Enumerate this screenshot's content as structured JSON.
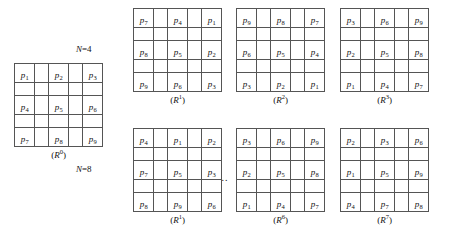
{
  "figure": {
    "caption_prefix": "(",
    "caption_suffix": ")",
    "ellipsis": "...",
    "rows": [
      {
        "id": "row-n4",
        "n_label_text": "N=4",
        "n_label_var": "N",
        "n_label_rest": "=4"
      },
      {
        "id": "row-n8",
        "n_label_text": "N=8",
        "n_label_var": "N",
        "n_label_rest": "=8"
      }
    ]
  },
  "grids": [
    {
      "id": "grid-r0",
      "name": "base-grid",
      "caption_symbol": "R",
      "caption_exponent": "0",
      "caption_full": "(R0)",
      "cells": [
        [
          "p1",
          "",
          "p2",
          "",
          "p3"
        ],
        [
          "",
          "",
          "",
          "",
          ""
        ],
        [
          "p4",
          "",
          "p5",
          "",
          "p6"
        ],
        [
          "",
          "",
          "",
          "",
          ""
        ],
        [
          "p7",
          "",
          "p8",
          "",
          "p9"
        ]
      ],
      "labels": [
        [
          {
            "base": "p",
            "sub": "1"
          },
          null,
          {
            "base": "p",
            "sub": "2"
          },
          null,
          {
            "base": "p",
            "sub": "3"
          }
        ],
        [
          null,
          null,
          null,
          null,
          null
        ],
        [
          {
            "base": "p",
            "sub": "4"
          },
          null,
          {
            "base": "p",
            "sub": "5"
          },
          null,
          {
            "base": "p",
            "sub": "6"
          }
        ],
        [
          null,
          null,
          null,
          null,
          null
        ],
        [
          {
            "base": "p",
            "sub": "7"
          },
          null,
          {
            "base": "p",
            "sub": "8"
          },
          null,
          {
            "base": "p",
            "sub": "9"
          }
        ]
      ]
    },
    {
      "id": "grid-n4-r1",
      "name": "n4-rotation-1",
      "caption_symbol": "R",
      "caption_exponent": "1",
      "caption_full": "(R1)",
      "labels": [
        [
          {
            "base": "p",
            "sub": "7"
          },
          null,
          {
            "base": "p",
            "sub": "4"
          },
          null,
          {
            "base": "p",
            "sub": "1"
          }
        ],
        [
          null,
          null,
          null,
          null,
          null
        ],
        [
          {
            "base": "p",
            "sub": "8"
          },
          null,
          {
            "base": "p",
            "sub": "5"
          },
          null,
          {
            "base": "p",
            "sub": "2"
          }
        ],
        [
          null,
          null,
          null,
          null,
          null
        ],
        [
          {
            "base": "p",
            "sub": "9"
          },
          null,
          {
            "base": "p",
            "sub": "6"
          },
          null,
          {
            "base": "p",
            "sub": "3"
          }
        ]
      ]
    },
    {
      "id": "grid-n4-r2",
      "name": "n4-rotation-2",
      "caption_symbol": "R",
      "caption_exponent": "2",
      "caption_full": "(R2)",
      "labels": [
        [
          {
            "base": "p",
            "sub": "9"
          },
          null,
          {
            "base": "p",
            "sub": "8"
          },
          null,
          {
            "base": "p",
            "sub": "7"
          }
        ],
        [
          null,
          null,
          null,
          null,
          null
        ],
        [
          {
            "base": "p",
            "sub": "6"
          },
          null,
          {
            "base": "p",
            "sub": "5"
          },
          null,
          {
            "base": "p",
            "sub": "4"
          }
        ],
        [
          null,
          null,
          null,
          null,
          null
        ],
        [
          {
            "base": "p",
            "sub": "3"
          },
          null,
          {
            "base": "p",
            "sub": "2"
          },
          null,
          {
            "base": "p",
            "sub": "1"
          }
        ]
      ]
    },
    {
      "id": "grid-n4-r3",
      "name": "n4-rotation-3",
      "caption_symbol": "R",
      "caption_exponent": "3",
      "caption_full": "(R3)",
      "labels": [
        [
          {
            "base": "p",
            "sub": "3"
          },
          null,
          {
            "base": "p",
            "sub": "6"
          },
          null,
          {
            "base": "p",
            "sub": "9"
          }
        ],
        [
          null,
          null,
          null,
          null,
          null
        ],
        [
          {
            "base": "p",
            "sub": "2"
          },
          null,
          {
            "base": "p",
            "sub": "5"
          },
          null,
          {
            "base": "p",
            "sub": "8"
          }
        ],
        [
          null,
          null,
          null,
          null,
          null
        ],
        [
          {
            "base": "p",
            "sub": "1"
          },
          null,
          {
            "base": "p",
            "sub": "4"
          },
          null,
          {
            "base": "p",
            "sub": "7"
          }
        ]
      ]
    },
    {
      "id": "grid-n8-r1",
      "name": "n8-rotation-1",
      "caption_symbol": "R",
      "caption_exponent": "1",
      "caption_full": "(R1)",
      "labels": [
        [
          {
            "base": "p",
            "sub": "4"
          },
          null,
          {
            "base": "p",
            "sub": "1"
          },
          null,
          {
            "base": "p",
            "sub": "2"
          }
        ],
        [
          null,
          null,
          null,
          null,
          null
        ],
        [
          {
            "base": "p",
            "sub": "7"
          },
          null,
          {
            "base": "p",
            "sub": "5"
          },
          null,
          {
            "base": "p",
            "sub": "3"
          }
        ],
        [
          null,
          null,
          null,
          null,
          null
        ],
        [
          {
            "base": "p",
            "sub": "8"
          },
          null,
          {
            "base": "p",
            "sub": "9"
          },
          null,
          {
            "base": "p",
            "sub": "6"
          }
        ]
      ]
    },
    {
      "id": "grid-n8-r6",
      "name": "n8-rotation-6",
      "caption_symbol": "R",
      "caption_exponent": "6",
      "caption_full": "(R6)",
      "labels": [
        [
          {
            "base": "p",
            "sub": "3"
          },
          null,
          {
            "base": "p",
            "sub": "6"
          },
          null,
          {
            "base": "p",
            "sub": "9"
          }
        ],
        [
          null,
          null,
          null,
          null,
          null
        ],
        [
          {
            "base": "p",
            "sub": "2"
          },
          null,
          {
            "base": "p",
            "sub": "5"
          },
          null,
          {
            "base": "p",
            "sub": "8"
          }
        ],
        [
          null,
          null,
          null,
          null,
          null
        ],
        [
          {
            "base": "p",
            "sub": "1"
          },
          null,
          {
            "base": "p",
            "sub": "4"
          },
          null,
          {
            "base": "p",
            "sub": "7"
          }
        ]
      ]
    },
    {
      "id": "grid-n8-r7",
      "name": "n8-rotation-7",
      "caption_symbol": "R",
      "caption_exponent": "7",
      "caption_full": "(R7)",
      "labels": [
        [
          {
            "base": "p",
            "sub": "2"
          },
          null,
          {
            "base": "p",
            "sub": "3"
          },
          null,
          {
            "base": "p",
            "sub": "6"
          }
        ],
        [
          null,
          null,
          null,
          null,
          null
        ],
        [
          {
            "base": "p",
            "sub": "1"
          },
          null,
          {
            "base": "p",
            "sub": "5"
          },
          null,
          {
            "base": "p",
            "sub": "9"
          }
        ],
        [
          null,
          null,
          null,
          null,
          null
        ],
        [
          {
            "base": "p",
            "sub": "4"
          },
          null,
          {
            "base": "p",
            "sub": "7"
          },
          null,
          {
            "base": "p",
            "sub": "8"
          }
        ]
      ]
    }
  ],
  "layout": {
    "grid_positions": {
      "grid-r0": {
        "left": 14,
        "top": 63
      },
      "grid-n4-r1": {
        "left": 133,
        "top": 8
      },
      "grid-n4-r2": {
        "left": 236,
        "top": 8
      },
      "grid-n4-r3": {
        "left": 340,
        "top": 8
      },
      "grid-n8-r1": {
        "left": 133,
        "top": 128
      },
      "grid-n8-r6": {
        "left": 236,
        "top": 128
      },
      "grid-n8-r7": {
        "left": 340,
        "top": 128
      }
    },
    "n_label_positions": {
      "row-n4": {
        "left": 76,
        "top": 45
      },
      "row-n8": {
        "left": 76,
        "top": 165
      }
    },
    "ellipsis_position": {
      "left": 218,
      "top": 173
    }
  }
}
